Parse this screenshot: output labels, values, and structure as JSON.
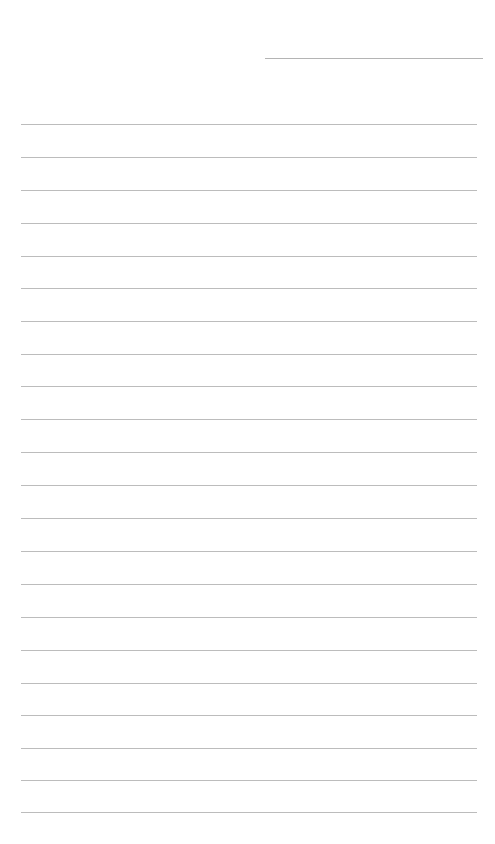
{
  "page": {
    "width": 495,
    "height": 844,
    "background_color": "#ffffff",
    "content_text": ""
  },
  "ink": {
    "rule_color": "#bcbcbc",
    "header_rule_color": "#b4b4b4",
    "rule_thickness_px": 1
  },
  "header_rule": {
    "label": "header-rule",
    "value": "",
    "x": 265,
    "y": 58,
    "width": 218
  },
  "body_rules": [
    {
      "index": 1,
      "value": "",
      "y": 124,
      "x": 21,
      "width": 456
    },
    {
      "index": 2,
      "value": "",
      "y": 157,
      "x": 21,
      "width": 456
    },
    {
      "index": 3,
      "value": "",
      "y": 190,
      "x": 21,
      "width": 456
    },
    {
      "index": 4,
      "value": "",
      "y": 223,
      "x": 21,
      "width": 456
    },
    {
      "index": 5,
      "value": "",
      "y": 256,
      "x": 21,
      "width": 456
    },
    {
      "index": 6,
      "value": "",
      "y": 288,
      "x": 21,
      "width": 456
    },
    {
      "index": 7,
      "value": "",
      "y": 321,
      "x": 21,
      "width": 456
    },
    {
      "index": 8,
      "value": "",
      "y": 354,
      "x": 21,
      "width": 456
    },
    {
      "index": 9,
      "value": "",
      "y": 386,
      "x": 21,
      "width": 456
    },
    {
      "index": 10,
      "value": "",
      "y": 419,
      "x": 21,
      "width": 456
    },
    {
      "index": 11,
      "value": "",
      "y": 452,
      "x": 21,
      "width": 456
    },
    {
      "index": 12,
      "value": "",
      "y": 485,
      "x": 21,
      "width": 456
    },
    {
      "index": 13,
      "value": "",
      "y": 518,
      "x": 21,
      "width": 456
    },
    {
      "index": 14,
      "value": "",
      "y": 551,
      "x": 21,
      "width": 456
    },
    {
      "index": 15,
      "value": "",
      "y": 584,
      "x": 21,
      "width": 456
    },
    {
      "index": 16,
      "value": "",
      "y": 617,
      "x": 21,
      "width": 456
    },
    {
      "index": 17,
      "value": "",
      "y": 650,
      "x": 21,
      "width": 456
    },
    {
      "index": 18,
      "value": "",
      "y": 683,
      "x": 21,
      "width": 456
    },
    {
      "index": 19,
      "value": "",
      "y": 715,
      "x": 21,
      "width": 456
    },
    {
      "index": 20,
      "value": "",
      "y": 748,
      "x": 21,
      "width": 456
    },
    {
      "index": 21,
      "value": "",
      "y": 780,
      "x": 21,
      "width": 456
    },
    {
      "index": 22,
      "value": "",
      "y": 812,
      "x": 21,
      "width": 456
    }
  ]
}
